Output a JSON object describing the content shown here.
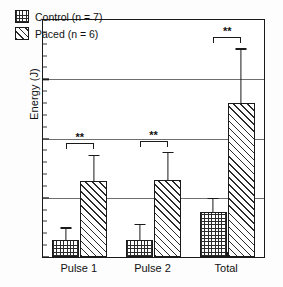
{
  "chart_data": {
    "type": "bar",
    "title": "",
    "subtitle": "",
    "xlabel": "",
    "ylabel": "Energy (J)",
    "categories": [
      "Pulse 1",
      "Pulse 2",
      "Total"
    ],
    "ylim": [
      0,
      20
    ],
    "y_ticks": [
      0,
      5,
      10,
      15,
      20
    ],
    "y_tick_labels": [
      "0",
      "5",
      "10",
      "15",
      "20"
    ],
    "y_minor_tick_step": 1,
    "grid": "horizontal-major",
    "legend_position": "top-left",
    "error_bar_type": "upper-only",
    "series": [
      {
        "name": "Control (n = 7)",
        "short_name": "Control",
        "n": 7,
        "hatch": "crosshatch",
        "values": [
          1.4,
          1.4,
          3.8
        ],
        "errors": [
          1.1,
          1.4,
          1.2
        ]
      },
      {
        "name": "Paced (n = 6)",
        "short_name": "Paced",
        "n": 6,
        "hatch": "diagonal",
        "values": [
          6.4,
          6.5,
          13.0
        ],
        "errors": [
          2.2,
          2.4,
          4.6
        ]
      }
    ],
    "annotations": [
      {
        "category": "Pulse 1",
        "text": "**",
        "bracket_top_value": 9.6
      },
      {
        "category": "Pulse 2",
        "text": "**",
        "bracket_top_value": 9.8
      },
      {
        "category": "Total",
        "text": "**",
        "bracket_top_value": 18.6
      }
    ]
  },
  "legend": {
    "items": [
      {
        "label": "Control (n = 7)",
        "hatch": "crosshatch"
      },
      {
        "label": "Paced (n = 6)",
        "hatch": "diagonal"
      }
    ]
  },
  "axes": {
    "y_title": "Energy (J)",
    "y_labels": [
      "20",
      "15",
      "10",
      "5",
      "0"
    ],
    "x_labels": [
      "Pulse 1",
      "Pulse 2",
      "Total"
    ]
  }
}
